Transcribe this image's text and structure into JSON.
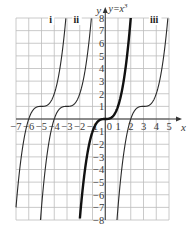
{
  "chart_data": {
    "type": "line",
    "title": "",
    "xlabel": "x",
    "ylabel": "y",
    "xlim": [
      -7,
      5
    ],
    "ylim": [
      -8,
      8
    ],
    "grid": true,
    "x_ticks": [
      -7,
      -6,
      -5,
      -4,
      -3,
      -2,
      -1,
      0,
      1,
      2,
      3,
      4,
      5
    ],
    "x_tick_labels": [
      "−7",
      "−6",
      "−5",
      "−4",
      "−3",
      "−2",
      "−1",
      "0",
      "1",
      "2",
      "3",
      "4",
      "5"
    ],
    "y_ticks": [
      8,
      7,
      6,
      5,
      4,
      3,
      2,
      1,
      -1,
      -2,
      -3,
      -4,
      -5,
      -6,
      -7,
      -8
    ],
    "y_tick_labels": [
      "8",
      "7",
      "6",
      "5",
      "4",
      "3",
      "2",
      "1",
      "−1",
      "−2",
      "−3",
      "−4",
      "−5",
      "−6",
      "−7",
      "−8"
    ],
    "series": [
      {
        "name": "i",
        "label": "i",
        "h": -5,
        "k": 1,
        "bold": false,
        "label_pos": [
          -4.4,
          7.6
        ]
      },
      {
        "name": "ii",
        "label": "ii",
        "h": -3,
        "k": 1,
        "bold": false,
        "label_pos": [
          -2.5,
          7.6
        ]
      },
      {
        "name": "y=x³",
        "label": "y=x³",
        "h": 0,
        "k": 0,
        "bold": true,
        "label_pos": [
          0.25,
          8.45
        ]
      },
      {
        "name": "iii",
        "label": "iii",
        "h": 3,
        "k": 1,
        "bold": false,
        "label_pos": [
          3.5,
          7.6
        ]
      }
    ],
    "annotations": [
      "i",
      "ii",
      "iii",
      "y=x³"
    ]
  },
  "labels": {
    "x_axis": "x",
    "y_axis": "y",
    "eq": "y=x",
    "eq_exp": "3"
  }
}
